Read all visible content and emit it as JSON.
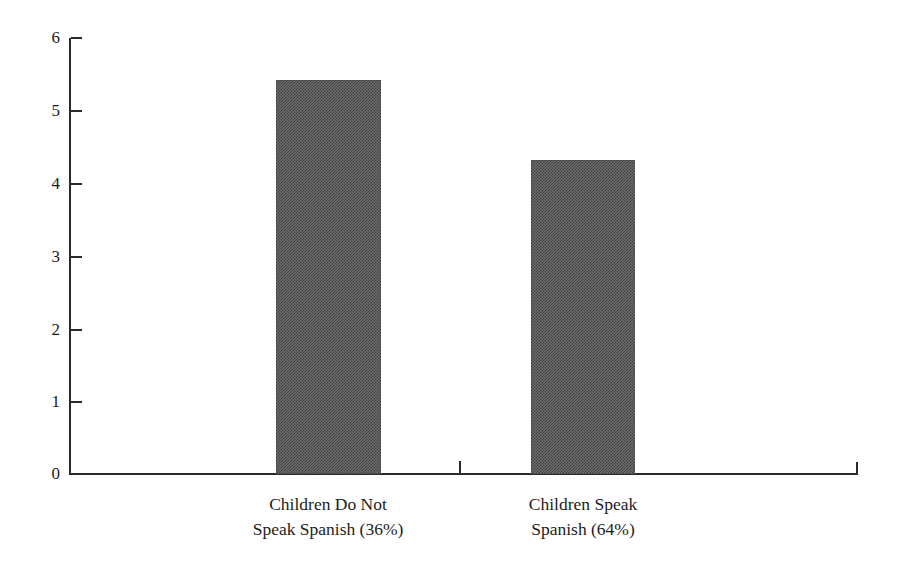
{
  "chart_data": {
    "type": "bar",
    "title": "",
    "subtitle": "",
    "xlabel": "",
    "ylabel": "",
    "categories": [
      "Children Do Not Speak Spanish (36%)",
      "Children Speak Spanish (64%)"
    ],
    "category_lines": [
      [
        "Children Do Not",
        "Speak Spanish (36%)"
      ],
      [
        "Children Speak",
        "Spanish (64%)"
      ]
    ],
    "values": [
      5.4,
      4.3
    ],
    "ylim": [
      0,
      6
    ],
    "y_ticks": [
      0,
      1,
      2,
      3,
      4,
      5,
      6
    ],
    "y_tick_labels": [
      "0",
      "1",
      "2",
      "3",
      "4",
      "5",
      "6"
    ],
    "grid": false,
    "legend": false,
    "legend_position": "none",
    "bar_color": "#6e6e6e",
    "axis_color": "#2b2b2b",
    "background_color": "#ffffff"
  },
  "axis": {
    "y_tick_labels": [
      "6",
      "5",
      "4",
      "3",
      "2",
      "1",
      "0"
    ]
  },
  "bars": [
    {
      "label": "Children Do Not Speak Spanish (36%)",
      "value": "5.4"
    },
    {
      "label": "Children Speak Spanish (64%)",
      "value": "4.3"
    }
  ],
  "categories": [
    {
      "line1": "Children Do Not",
      "line2": "Speak Spanish (36%)"
    },
    {
      "line1": "Children Speak",
      "line2": "Spanish (64%)"
    }
  ]
}
